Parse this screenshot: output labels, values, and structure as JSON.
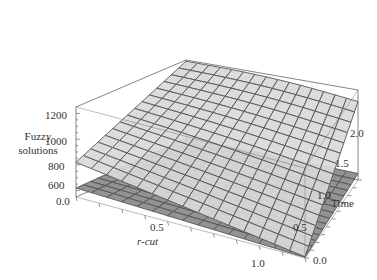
{
  "chart_data": {
    "type": "surface3d",
    "title": "",
    "xlabel": "r-cut",
    "ylabel": "Time",
    "zlabel": "Fuzzy solutions",
    "zlabel_lines": [
      "Fuzzy",
      "solutions"
    ],
    "x_ticks": [
      "0.0",
      "0.5",
      "1.0"
    ],
    "y_ticks": [
      "0.0",
      "0.5",
      "1.0",
      "1.5",
      "2.0"
    ],
    "z_ticks": [
      "600",
      "800",
      "1000",
      "1200"
    ],
    "xlim": [
      0,
      1
    ],
    "ylim": [
      0,
      2
    ],
    "zlim": [
      550,
      1250
    ],
    "grid_divisions": 15,
    "series": [
      {
        "name": "upper surface",
        "corners": {
          "x0y0": 820,
          "x1y0": 560,
          "x0y2": 1240,
          "x1y2": 1160
        },
        "color": "#d9d9d9"
      },
      {
        "name": "lower surface",
        "corners": {
          "x0y0": 620,
          "x1y0": 555,
          "x0y2": 640,
          "x1y2": 600
        },
        "color": "#8c8c8c"
      }
    ],
    "box": true,
    "colors": {
      "mesh": "#555555",
      "frame": "#666666",
      "upper_fill": "#d9d9d9",
      "lower_fill": "#8a8a8a"
    }
  }
}
